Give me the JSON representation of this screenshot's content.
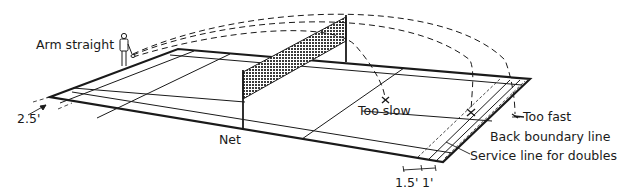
{
  "diagram": {
    "labels": {
      "arm_straight": "Arm straight",
      "net": "Net",
      "too_slow": "Too slow",
      "too_fast": "Too fast",
      "back_boundary_line": "Back boundary line",
      "service_line_doubles": "Service line for doubles",
      "dim_left": "2.5'",
      "dim_bottom_1": "1.5'",
      "dim_bottom_2": "1'"
    },
    "colors": {
      "ink": "#1a1a1a",
      "background": "#ffffff",
      "net_fill": "#555555"
    }
  }
}
